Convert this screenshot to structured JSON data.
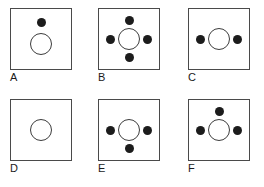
{
  "figure": {
    "type": "shape-matrix-diagram",
    "panel_count": 6,
    "columns": 3,
    "rows": 2,
    "colors": {
      "dot_fill": "#1c1c1c",
      "circle_stroke": "#3c3c3c",
      "box_stroke": "#4a4a4a",
      "background": "#ffffff",
      "label_color": "#1a1a1a"
    },
    "panels": [
      {
        "label": "A",
        "dot_count": 1,
        "dots": [
          "top"
        ],
        "has_center_circle": true,
        "x": 10,
        "y": 8
      },
      {
        "label": "B",
        "dot_count": 4,
        "dots": [
          "top",
          "left",
          "right",
          "bottom"
        ],
        "has_center_circle": true,
        "x": 98,
        "y": 8
      },
      {
        "label": "C",
        "dot_count": 2,
        "dots": [
          "left",
          "right"
        ],
        "has_center_circle": true,
        "x": 188,
        "y": 8
      },
      {
        "label": "D",
        "dot_count": 0,
        "dots": [],
        "has_center_circle": true,
        "x": 10,
        "y": 99
      },
      {
        "label": "E",
        "dot_count": 3,
        "dots": [
          "left",
          "right",
          "bottom"
        ],
        "has_center_circle": true,
        "x": 98,
        "y": 99
      },
      {
        "label": "F",
        "dot_count": 3,
        "dots": [
          "top",
          "left",
          "right"
        ],
        "has_center_circle": true,
        "x": 188,
        "y": 99
      }
    ]
  }
}
